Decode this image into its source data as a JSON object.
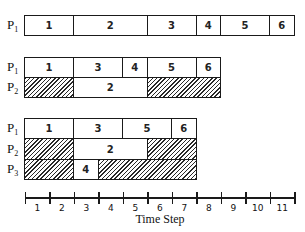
{
  "diagram": {
    "type": "gantt-schedule",
    "unit_px": 24.5,
    "origin_x": 25,
    "sections": [
      {
        "rows": [
          {
            "label": "P",
            "sub": "1",
            "segments": [
              {
                "task": "1",
                "start": 0,
                "end": 2
              },
              {
                "task": "2",
                "start": 2,
                "end": 5
              },
              {
                "task": "3",
                "start": 5,
                "end": 7
              },
              {
                "task": "4",
                "start": 7,
                "end": 8
              },
              {
                "task": "5",
                "start": 8,
                "end": 10
              },
              {
                "task": "6",
                "start": 10,
                "end": 11
              }
            ]
          }
        ]
      },
      {
        "rows": [
          {
            "label": "P",
            "sub": "1",
            "segments": [
              {
                "task": "1",
                "start": 0,
                "end": 2
              },
              {
                "task": "3",
                "start": 2,
                "end": 4
              },
              {
                "task": "4",
                "start": 4,
                "end": 5
              },
              {
                "task": "5",
                "start": 5,
                "end": 7
              },
              {
                "task": "6",
                "start": 7,
                "end": 8
              }
            ]
          },
          {
            "label": "P",
            "sub": "2",
            "segments": [
              {
                "task": "",
                "idle": true,
                "start": 0,
                "end": 2
              },
              {
                "task": "2",
                "start": 2,
                "end": 5
              },
              {
                "task": "",
                "idle": true,
                "start": 5,
                "end": 8
              }
            ]
          }
        ]
      },
      {
        "rows": [
          {
            "label": "P",
            "sub": "1",
            "segments": [
              {
                "task": "1",
                "start": 0,
                "end": 2
              },
              {
                "task": "3",
                "start": 2,
                "end": 4
              },
              {
                "task": "5",
                "start": 4,
                "end": 6
              },
              {
                "task": "6",
                "start": 6,
                "end": 7
              }
            ]
          },
          {
            "label": "P",
            "sub": "2",
            "segments": [
              {
                "task": "",
                "idle": true,
                "start": 0,
                "end": 2
              },
              {
                "task": "2",
                "start": 2,
                "end": 5
              },
              {
                "task": "",
                "idle": true,
                "start": 5,
                "end": 7
              }
            ]
          },
          {
            "label": "P",
            "sub": "3",
            "segments": [
              {
                "task": "",
                "idle": true,
                "start": 0,
                "end": 2
              },
              {
                "task": "4",
                "start": 2,
                "end": 3
              },
              {
                "task": "",
                "idle": true,
                "start": 3,
                "end": 7
              }
            ]
          }
        ]
      }
    ],
    "row_tops": [
      [
        15
      ],
      [
        57,
        77
      ],
      [
        118,
        138,
        159
      ]
    ],
    "axis": {
      "label": "Time Step",
      "ticks": [
        "1",
        "2",
        "3",
        "4",
        "5",
        "6",
        "7",
        "8",
        "9",
        "10",
        "11"
      ]
    }
  }
}
